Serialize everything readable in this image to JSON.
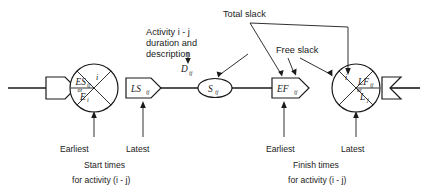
{
  "diagram": {
    "type": "network-notation",
    "stroke_color": "#1a1a1a",
    "background_color": "#ffffff"
  },
  "annotations": {
    "activity_label": {
      "line1": "Activity  i - j",
      "line2": "duration and",
      "line3": "description"
    },
    "total_slack": "Total slack",
    "free_slack": "Free slack"
  },
  "nodes": {
    "start_event": {
      "name": "start-event-circle",
      "top_label": "i",
      "main": "ES",
      "main_sub": "ij",
      "or": "or",
      "alt": "E",
      "alt_sub": "i"
    },
    "latest_start": {
      "name": "latest-start-pentagon",
      "main": "LS",
      "main_sub": "ij"
    },
    "duration": {
      "name": "duration-label",
      "main": "D",
      "main_sub": "ij"
    },
    "slack": {
      "name": "slack-oval",
      "main": "S",
      "main_sub": "ij"
    },
    "earliest_finish": {
      "name": "earliest-finish-pentagon",
      "main": "EF",
      "main_sub": "ij"
    },
    "finish_event": {
      "name": "finish-event-circle",
      "top_label": "i",
      "main": "LF",
      "main_sub": "ij",
      "or": "or",
      "alt": "L",
      "alt_sub": "j"
    }
  },
  "captions": {
    "left": {
      "earliest": "Earliest",
      "latest": "Latest",
      "line1": "Start times",
      "line2": "for activity (i - j)"
    },
    "right": {
      "earliest": "Earliest",
      "latest": "Latest",
      "line1": "Finish times",
      "line2": "for activity (i - j)"
    }
  }
}
